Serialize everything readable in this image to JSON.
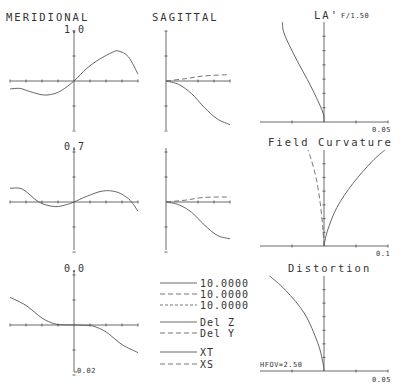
{
  "chart_data": [
    {
      "type": "line",
      "title": "MERIDIONAL",
      "subplots": [
        {
          "field_label": "1.0",
          "series": [
            {
              "name": "10.0000",
              "style": "solid",
              "x": [
                -1,
                -0.85,
                -0.7,
                -0.5,
                -0.35,
                -0.2,
                0,
                0.2,
                0.4,
                0.6,
                0.7,
                0.85,
                1.0
              ],
              "y": [
                -0.35,
                -0.32,
                -0.45,
                -0.6,
                -0.58,
                -0.42,
                0,
                0.55,
                0.95,
                1.25,
                1.3,
                1.05,
                0.3
              ]
            }
          ]
        },
        {
          "field_label": "0.7",
          "series": [
            {
              "name": "10.0000",
              "style": "solid",
              "x": [
                -1,
                -0.8,
                -0.55,
                -0.3,
                -0.1,
                0,
                0.2,
                0.45,
                0.65,
                0.8,
                0.9,
                1.0
              ],
              "y": [
                0.6,
                0.55,
                0.0,
                -0.2,
                -0.1,
                0,
                0.25,
                0.48,
                0.45,
                0.25,
                0.0,
                -0.4
              ]
            }
          ]
        },
        {
          "field_label": "0.0",
          "series": [
            {
              "name": "10.0000",
              "style": "solid",
              "x": [
                -1,
                -0.75,
                -0.5,
                -0.3,
                -0.15,
                0,
                0.15,
                0.3,
                0.5,
                0.75,
                1.0
              ],
              "y": [
                1.2,
                0.85,
                0.3,
                0.05,
                0.01,
                0,
                -0.01,
                -0.05,
                -0.3,
                -0.85,
                -1.2
              ]
            }
          ]
        }
      ],
      "ylim": [
        -0.02,
        0.02
      ],
      "axis_label": "0.02"
    },
    {
      "type": "line",
      "title": "SAGITTAL",
      "subplots": [
        {
          "series": [
            {
              "name": "10.0000",
              "style": "solid",
              "x": [
                0,
                0.2,
                0.4,
                0.6,
                0.8,
                1.0
              ],
              "y": [
                0,
                -0.15,
                -0.55,
                -1.15,
                -1.65,
                -1.9
              ]
            },
            {
              "name": "10.0000",
              "style": "dashed",
              "x": [
                0,
                0.3,
                0.6,
                1.0
              ],
              "y": [
                0,
                0.1,
                0.22,
                0.28
              ]
            }
          ]
        },
        {
          "series": [
            {
              "name": "10.0000",
              "style": "solid",
              "x": [
                0,
                0.2,
                0.4,
                0.6,
                0.8,
                1.0
              ],
              "y": [
                0,
                -0.12,
                -0.45,
                -1.0,
                -1.45,
                -1.6
              ]
            },
            {
              "name": "10.0000",
              "style": "dashed",
              "x": [
                0,
                0.3,
                0.6,
                1.0
              ],
              "y": [
                0,
                0.08,
                0.2,
                0.22
              ]
            }
          ]
        }
      ]
    },
    {
      "type": "line",
      "title": "LA'",
      "subtitle": "F/1.50",
      "xlabel": "0.05",
      "series": [
        {
          "name": "LA'",
          "style": "solid",
          "x": [
            0,
            -0.02,
            -0.2,
            -0.45,
            -0.62,
            -0.65
          ],
          "y": [
            0,
            0.1,
            0.35,
            0.65,
            0.88,
            1.0
          ]
        }
      ]
    },
    {
      "type": "line",
      "title": "Field Curvature",
      "xlabel": "0.1",
      "series": [
        {
          "name": "XT",
          "style": "solid",
          "x": [
            0,
            0.05,
            0.2,
            0.45,
            0.75,
            0.95
          ],
          "y": [
            0,
            0.15,
            0.4,
            0.65,
            0.88,
            1.0
          ]
        },
        {
          "name": "XS",
          "style": "dashed",
          "x": [
            0,
            -0.02,
            -0.06,
            -0.12,
            -0.2,
            -0.25
          ],
          "y": [
            0,
            0.2,
            0.45,
            0.7,
            0.9,
            1.0
          ]
        }
      ]
    },
    {
      "type": "line",
      "title": "Distortion",
      "xlabel": "0.05",
      "annotation": "HFOV=2.50",
      "series": [
        {
          "name": "Distortion",
          "style": "solid",
          "x": [
            0,
            -0.02,
            -0.1,
            -0.3,
            -0.6,
            -0.85
          ],
          "y": [
            0,
            0.1,
            0.3,
            0.6,
            0.85,
            1.0
          ]
        }
      ]
    }
  ],
  "titles": {
    "meridional": "MERIDIONAL",
    "sagittal": "SAGITTAL",
    "la": "LA'",
    "fnum": "F/1.50",
    "field_curvature": "Field Curvature",
    "distortion": "Distortion"
  },
  "field_labels": {
    "f1": "1.0",
    "f2": "0.7",
    "f3": "0.0"
  },
  "axis_labels": {
    "ray_scale": "0.02",
    "la_scale": "0.05",
    "fc_scale": "0.1",
    "dist_scale": "0.05",
    "hfov": "HFOV=2.50"
  },
  "legend": {
    "wavelengths": [
      "10.0000",
      "10.0000",
      "10.0000"
    ],
    "del_z": "Del Z",
    "del_y": "Del Y",
    "xt": "XT",
    "xs": "XS"
  }
}
